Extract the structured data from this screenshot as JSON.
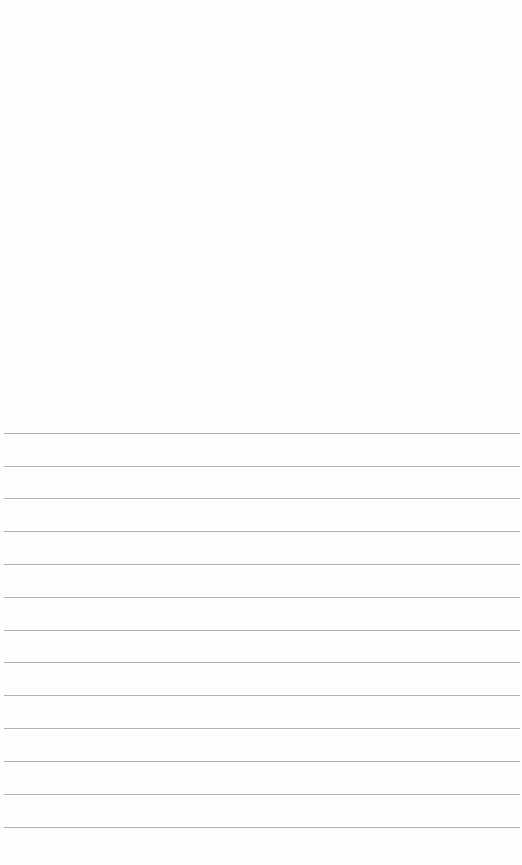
{
  "document": {
    "type": "ruled-paper",
    "background_color": "#fefefe",
    "rule_color": "#b4b4b4",
    "rules": [
      {
        "y": 433
      },
      {
        "y": 466
      },
      {
        "y": 498
      },
      {
        "y": 531
      },
      {
        "y": 564
      },
      {
        "y": 597
      },
      {
        "y": 630
      },
      {
        "y": 662
      },
      {
        "y": 695
      },
      {
        "y": 728
      },
      {
        "y": 761
      },
      {
        "y": 794
      },
      {
        "y": 827
      }
    ]
  }
}
